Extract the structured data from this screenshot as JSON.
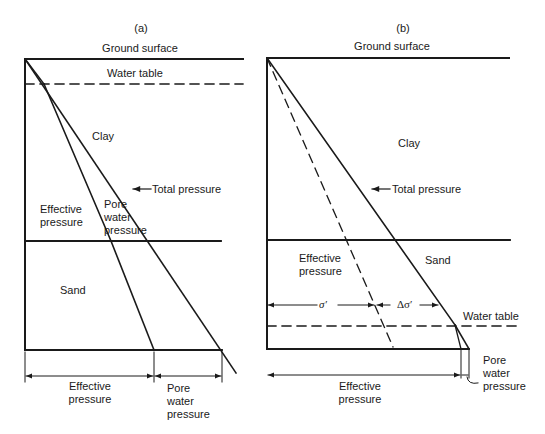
{
  "panel_a": {
    "title": "(a)",
    "ground_surface": "Ground surface",
    "water_table": "Water table",
    "clay": "Clay",
    "total_pressure": "Total pressure",
    "effective_pressure_line1": "Effective",
    "effective_pressure_line2": "pressure",
    "pore_line1": "Pore",
    "pore_line2": "water",
    "pore_line3": "pressure",
    "sand": "Sand",
    "dim_effective_line1": "Effective",
    "dim_effective_line2": "pressure",
    "dim_pore_line1": "Pore",
    "dim_pore_line2": "water",
    "dim_pore_line3": "pressure"
  },
  "panel_b": {
    "title": "(b)",
    "ground_surface": "Ground surface",
    "clay": "Clay",
    "total_pressure": "Total pressure",
    "effective_pressure_line1": "Effective",
    "effective_pressure_line2": "pressure",
    "sand": "Sand",
    "sigma_prime": "σ′",
    "delta_sigma_prime": "Δσ′",
    "water_table": "Water table",
    "dim_effective_line1": "Effective",
    "dim_effective_line2": "pressure",
    "dim_pore_line1": "Pore",
    "dim_pore_line2": "water",
    "dim_pore_line3": "pressure"
  },
  "colors": {
    "ink": "#1a1a1a",
    "background": "#ffffff"
  }
}
